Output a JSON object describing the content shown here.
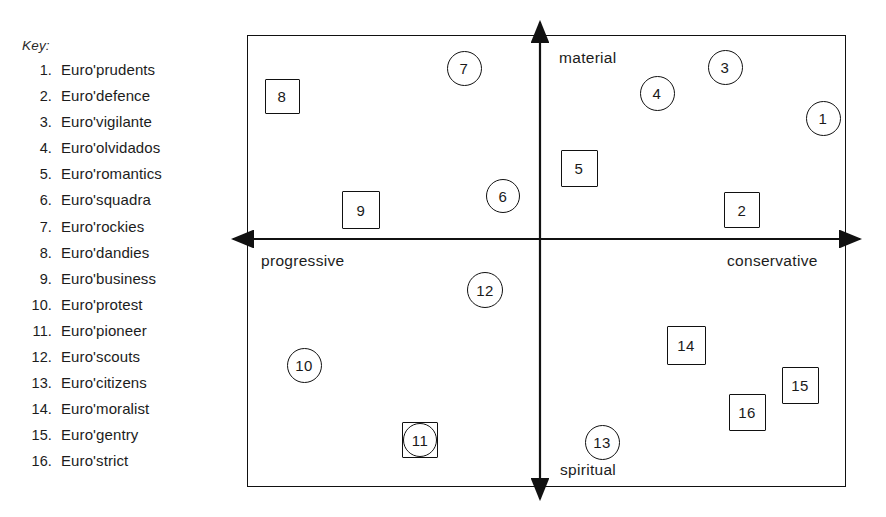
{
  "key": {
    "title": "Key:",
    "items": [
      {
        "num": "1.",
        "label": "Euro'prudents"
      },
      {
        "num": "2.",
        "label": "Euro'defence"
      },
      {
        "num": "3.",
        "label": "Euro'vigilante"
      },
      {
        "num": "4.",
        "label": "Euro'olvidados"
      },
      {
        "num": "5.",
        "label": "Euro'romantics"
      },
      {
        "num": "6.",
        "label": "Euro'squadra"
      },
      {
        "num": "7.",
        "label": "Euro'rockies"
      },
      {
        "num": "8.",
        "label": "Euro'dandies"
      },
      {
        "num": "9.",
        "label": "Euro'business"
      },
      {
        "num": "10.",
        "label": "Euro'protest"
      },
      {
        "num": "11.",
        "label": "Euro'pioneer"
      },
      {
        "num": "12.",
        "label": "Euro'scouts"
      },
      {
        "num": "13.",
        "label": "Euro'citizens"
      },
      {
        "num": "14.",
        "label": "Euro'moralist"
      },
      {
        "num": "15.",
        "label": "Euro'gentry"
      },
      {
        "num": "16.",
        "label": "Euro'strict"
      }
    ]
  },
  "diagram": {
    "axis_labels": {
      "top": "material",
      "bottom": "spiritual",
      "left": "progressive",
      "right": "conservative"
    },
    "stroke_color": "#111111",
    "background_color": "#ffffff"
  },
  "chart_data": {
    "type": "scatter",
    "title": "",
    "xlabel": "progressive — conservative",
    "ylabel": "spiritual — material",
    "xlim": [
      -1,
      1
    ],
    "ylim": [
      -1,
      1
    ],
    "grid": false,
    "legend": "left key list",
    "axis_annotations": {
      "x_negative": "progressive",
      "x_positive": "conservative",
      "y_positive": "material",
      "y_negative": "spiritual"
    },
    "marker_shapes": {
      "circle": "circle outline",
      "square": "square outline",
      "combo": "circle inscribed in square"
    },
    "points": [
      {
        "id": "1",
        "name": "Euro'prudents",
        "shape": "circle",
        "x": 0.945,
        "y": 0.464,
        "px": 823,
        "py": 118,
        "size": 35
      },
      {
        "id": "2",
        "name": "Euro'defence",
        "shape": "square",
        "x": 0.618,
        "y": 0.071,
        "px": 742,
        "py": 210,
        "size": 36
      },
      {
        "id": "3",
        "name": "Euro'vigilante",
        "shape": "circle",
        "x": 0.618,
        "y": 0.756,
        "px": 725,
        "py": 67,
        "size": 35
      },
      {
        "id": "4",
        "name": "Euro'olvidados",
        "shape": "circle",
        "x": 0.391,
        "y": 0.628,
        "px": 657,
        "py": 93,
        "size": 35
      },
      {
        "id": "5",
        "name": "Euro'romantics",
        "shape": "square",
        "x": 0.131,
        "y": 0.355,
        "px": 579,
        "py": 168,
        "size": 37
      },
      {
        "id": "6",
        "name": "Euro'squadra",
        "shape": "circle",
        "x": -0.124,
        "y": 0.211,
        "px": 503,
        "py": 196,
        "size": 34
      },
      {
        "id": "7",
        "name": "Euro'rockies",
        "shape": "circle",
        "x": -0.255,
        "y": 0.841,
        "px": 464,
        "py": 68,
        "size": 35
      },
      {
        "id": "8",
        "name": "Euro'dandies",
        "shape": "square",
        "x": -0.908,
        "y": 0.784,
        "px": 282,
        "py": 96,
        "size": 35
      },
      {
        "id": "9",
        "name": "Euro'business",
        "shape": "square",
        "x": -0.654,
        "y": 0.172,
        "px": 361,
        "py": 210,
        "size": 38
      },
      {
        "id": "10",
        "name": "Euro'protest",
        "shape": "circle",
        "x": -0.748,
        "y": -0.487,
        "px": 304,
        "py": 365,
        "size": 35
      },
      {
        "id": "11",
        "name": "Euro'pioneer",
        "shape": "combo",
        "x": -0.418,
        "y": -0.798,
        "px": 420,
        "py": 440,
        "size": 36
      },
      {
        "id": "12",
        "name": "Euro'scouts",
        "shape": "circle",
        "x": -0.374,
        "y": -0.235,
        "px": 485,
        "py": 290,
        "size": 36
      },
      {
        "id": "13",
        "name": "Euro'citizens",
        "shape": "circle",
        "x": 0.131,
        "y": -0.806,
        "px": 602,
        "py": 442,
        "size": 35
      },
      {
        "id": "14",
        "name": "Euro'moralist",
        "shape": "square",
        "x": 0.428,
        "y": -0.455,
        "px": 686,
        "py": 345,
        "size": 39
      },
      {
        "id": "15",
        "name": "Euro'gentry",
        "shape": "square",
        "x": 0.818,
        "y": -0.633,
        "px": 800,
        "py": 385,
        "size": 37
      },
      {
        "id": "16",
        "name": "Euro'strict",
        "shape": "square",
        "x": 0.638,
        "y": -0.752,
        "px": 747,
        "py": 412,
        "size": 37
      }
    ]
  }
}
